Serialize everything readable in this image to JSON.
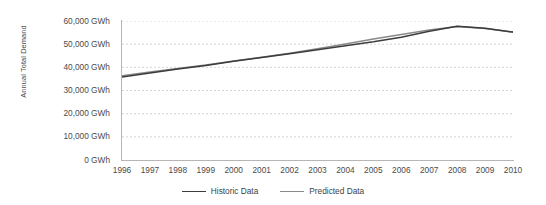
{
  "chart_data": {
    "type": "line",
    "title": "",
    "xlabel": "",
    "ylabel": "Annual Total Demand",
    "x": [
      1996,
      1997,
      1998,
      1999,
      2000,
      2001,
      2002,
      2003,
      2004,
      2005,
      2006,
      2007,
      2008,
      2009,
      2010
    ],
    "categories": [
      "1996",
      "1997",
      "1998",
      "1999",
      "2000",
      "2001",
      "2002",
      "2003",
      "2004",
      "2005",
      "2006",
      "2007",
      "2008",
      "2009",
      "2010"
    ],
    "series": [
      {
        "name": "Historic Data",
        "color": "#3c3c3c",
        "values": [
          35800,
          37600,
          39300,
          40800,
          42600,
          44200,
          45900,
          47600,
          49300,
          51000,
          53000,
          55600,
          57700,
          56900,
          55200
        ]
      },
      {
        "name": "Predicted Data",
        "color": "#8a8a8a",
        "values": [
          36400,
          38000,
          39500,
          41000,
          42700,
          44400,
          46100,
          48000,
          50100,
          52200,
          54200,
          56100,
          57600,
          56800,
          55200
        ]
      }
    ],
    "ylim": [
      0,
      60000
    ],
    "yticks": [
      0,
      10000,
      20000,
      30000,
      40000,
      50000,
      60000
    ],
    "ytick_labels": [
      "0 GWh",
      "10,000 GWh",
      "20,000 GWh",
      "30,000 GWh",
      "40,000 GWh",
      "50,000 GWh",
      "60,000 GWh"
    ],
    "grid": {
      "horizontal": true,
      "vertical": false,
      "style": "dashed",
      "color": "#cccccc"
    },
    "legend": {
      "position": "bottom",
      "entries": [
        {
          "label": "Historic Data",
          "color": "#3c3c3c"
        },
        {
          "label": "Predicted Data",
          "color": "#8a8a8a"
        }
      ]
    },
    "axis_color": "#b6b6b6",
    "background": "#ffffff"
  }
}
